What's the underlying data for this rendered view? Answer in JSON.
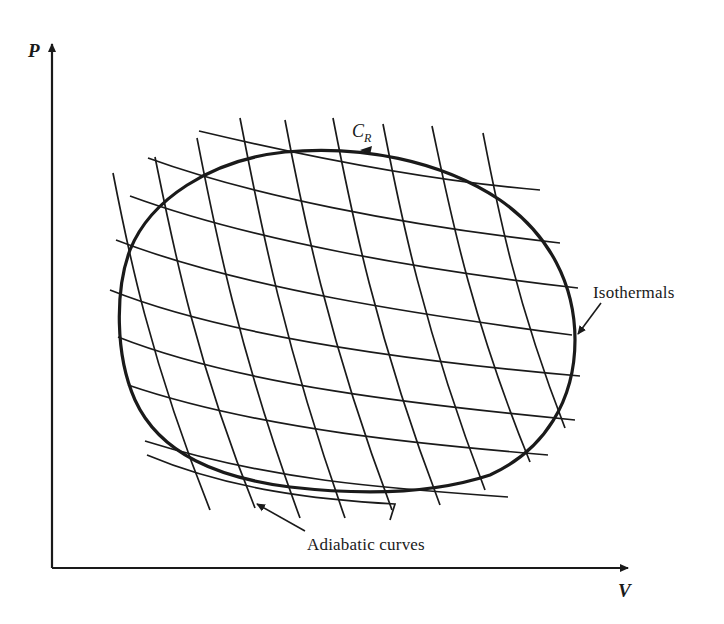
{
  "diagram": {
    "title": "",
    "axes": {
      "y_label": "P",
      "x_label": "V"
    },
    "cycle_label": {
      "main": "C",
      "subscript": "R"
    },
    "annotations": {
      "isothermals": "Isothermals",
      "adiabatic": "Adiabatic curves"
    },
    "colors": {
      "ink": "#1a1a1a",
      "background": "#ffffff"
    }
  }
}
